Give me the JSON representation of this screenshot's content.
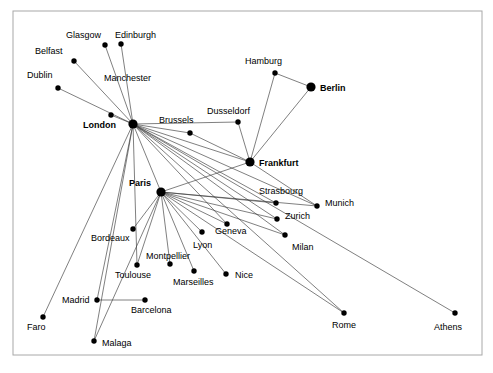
{
  "diagram": {
    "type": "node-link-network",
    "frame": {
      "x": 13,
      "y": 11,
      "width": 469,
      "height": 344,
      "stroke": "#a8a8a8"
    },
    "style": {
      "edge_color": "#3a3a3a",
      "node_color": "#000000",
      "background": "#ffffff",
      "hub_radius": 4.6,
      "node_radius": 2.7
    },
    "nodes": [
      {
        "id": "glasgow",
        "label": "Glasgow",
        "x": 105,
        "y": 45,
        "r": 2.7,
        "hub": false,
        "lx": 66,
        "ly": 38,
        "anchor": "start"
      },
      {
        "id": "edinburgh",
        "label": "Edinburgh",
        "x": 121,
        "y": 44,
        "r": 2.7,
        "hub": false,
        "lx": 115,
        "ly": 38,
        "anchor": "start"
      },
      {
        "id": "belfast",
        "label": "Belfast",
        "x": 74,
        "y": 61,
        "r": 2.7,
        "hub": false,
        "lx": 35,
        "ly": 54,
        "anchor": "start"
      },
      {
        "id": "dublin",
        "label": "Dublin",
        "x": 58,
        "y": 88,
        "r": 2.7,
        "hub": false,
        "lx": 27,
        "ly": 78,
        "anchor": "start"
      },
      {
        "id": "manchester",
        "label": "Manchester",
        "x": 111,
        "y": 115,
        "r": 2.7,
        "hub": false,
        "lx": 104,
        "ly": 81,
        "anchor": "start"
      },
      {
        "id": "london",
        "label": "London",
        "x": 133,
        "y": 124,
        "r": 4.6,
        "hub": true,
        "lx": 83,
        "ly": 128,
        "anchor": "start"
      },
      {
        "id": "brussels",
        "label": "Brussels",
        "x": 190,
        "y": 133,
        "r": 2.7,
        "hub": false,
        "lx": 159,
        "ly": 123,
        "anchor": "start"
      },
      {
        "id": "hamburg",
        "label": "Hamburg",
        "x": 275,
        "y": 73,
        "r": 2.7,
        "hub": false,
        "lx": 245,
        "ly": 64,
        "anchor": "start"
      },
      {
        "id": "berlin",
        "label": "Berlin",
        "x": 311,
        "y": 87,
        "r": 4.6,
        "hub": true,
        "lx": 320,
        "ly": 91,
        "anchor": "start"
      },
      {
        "id": "dusseldorf",
        "label": "Dusseldorf",
        "x": 238,
        "y": 122,
        "r": 2.7,
        "hub": false,
        "lx": 207,
        "ly": 114,
        "anchor": "start"
      },
      {
        "id": "frankfurt",
        "label": "Frankfurt",
        "x": 250,
        "y": 162,
        "r": 4.6,
        "hub": true,
        "lx": 259,
        "ly": 166,
        "anchor": "start"
      },
      {
        "id": "paris",
        "label": "Paris",
        "x": 161,
        "y": 192,
        "r": 4.6,
        "hub": true,
        "lx": 129,
        "ly": 186,
        "anchor": "start"
      },
      {
        "id": "strasbourg",
        "label": "Strasbourg",
        "x": 276,
        "y": 203,
        "r": 2.7,
        "hub": false,
        "lx": 259,
        "ly": 194,
        "anchor": "start"
      },
      {
        "id": "munich",
        "label": "Munich",
        "x": 317,
        "y": 206,
        "r": 2.7,
        "hub": false,
        "lx": 325,
        "ly": 206,
        "anchor": "start"
      },
      {
        "id": "zurich",
        "label": "Zurich",
        "x": 277,
        "y": 219,
        "r": 2.7,
        "hub": false,
        "lx": 285,
        "ly": 219,
        "anchor": "start"
      },
      {
        "id": "geneva",
        "label": "Geneva",
        "x": 227,
        "y": 224,
        "r": 2.7,
        "hub": false,
        "lx": 215,
        "ly": 234,
        "anchor": "start"
      },
      {
        "id": "milan",
        "label": "Milan",
        "x": 285,
        "y": 235,
        "r": 2.7,
        "hub": false,
        "lx": 292,
        "ly": 250,
        "anchor": "start"
      },
      {
        "id": "lyon",
        "label": "Lyon",
        "x": 202,
        "y": 232,
        "r": 2.7,
        "hub": false,
        "lx": 193,
        "ly": 248,
        "anchor": "start"
      },
      {
        "id": "bordeaux",
        "label": "Bordeaux",
        "x": 133,
        "y": 229,
        "r": 2.7,
        "hub": false,
        "lx": 91,
        "ly": 241,
        "anchor": "start"
      },
      {
        "id": "montpellier",
        "label": "Montpellier",
        "x": 170,
        "y": 264,
        "r": 2.7,
        "hub": false,
        "lx": 146,
        "ly": 259,
        "anchor": "start"
      },
      {
        "id": "toulouse",
        "label": "Toulouse",
        "x": 137,
        "y": 265,
        "r": 2.7,
        "hub": false,
        "lx": 115,
        "ly": 278,
        "anchor": "start"
      },
      {
        "id": "marseilles",
        "label": "Marseilles",
        "x": 194,
        "y": 271,
        "r": 2.7,
        "hub": false,
        "lx": 173,
        "ly": 285,
        "anchor": "start"
      },
      {
        "id": "nice",
        "label": "Nice",
        "x": 226,
        "y": 274,
        "r": 2.7,
        "hub": false,
        "lx": 235,
        "ly": 278,
        "anchor": "start"
      },
      {
        "id": "madrid",
        "label": "Madrid",
        "x": 97,
        "y": 300,
        "r": 2.7,
        "hub": false,
        "lx": 62,
        "ly": 303,
        "anchor": "start"
      },
      {
        "id": "barcelona",
        "label": "Barcelona",
        "x": 145,
        "y": 300,
        "r": 2.7,
        "hub": false,
        "lx": 131,
        "ly": 313,
        "anchor": "start"
      },
      {
        "id": "faro",
        "label": "Faro",
        "x": 43,
        "y": 317,
        "r": 2.7,
        "hub": false,
        "lx": 27,
        "ly": 330,
        "anchor": "start"
      },
      {
        "id": "malaga",
        "label": "Malaga",
        "x": 94,
        "y": 341,
        "r": 2.7,
        "hub": false,
        "lx": 102,
        "ly": 346,
        "anchor": "start"
      },
      {
        "id": "rome",
        "label": "Rome",
        "x": 344,
        "y": 313,
        "r": 2.7,
        "hub": false,
        "lx": 332,
        "ly": 328,
        "anchor": "start"
      },
      {
        "id": "athens",
        "label": "Athens",
        "x": 455,
        "y": 313,
        "r": 2.7,
        "hub": false,
        "lx": 434,
        "ly": 330,
        "anchor": "start"
      }
    ],
    "edges": [
      {
        "from": "london",
        "to": "glasgow"
      },
      {
        "from": "london",
        "to": "edinburgh"
      },
      {
        "from": "london",
        "to": "belfast"
      },
      {
        "from": "london",
        "to": "dublin"
      },
      {
        "from": "london",
        "to": "manchester"
      },
      {
        "from": "london",
        "to": "brussels"
      },
      {
        "from": "london",
        "to": "frankfurt"
      },
      {
        "from": "london",
        "to": "dusseldorf"
      },
      {
        "from": "london",
        "to": "paris"
      },
      {
        "from": "london",
        "to": "strasbourg"
      },
      {
        "from": "london",
        "to": "zurich"
      },
      {
        "from": "london",
        "to": "geneva"
      },
      {
        "from": "london",
        "to": "milan"
      },
      {
        "from": "london",
        "to": "munich"
      },
      {
        "from": "london",
        "to": "rome"
      },
      {
        "from": "london",
        "to": "athens"
      },
      {
        "from": "london",
        "to": "madrid"
      },
      {
        "from": "london",
        "to": "malaga"
      },
      {
        "from": "london",
        "to": "faro"
      },
      {
        "from": "london",
        "to": "toulouse"
      },
      {
        "from": "paris",
        "to": "bordeaux"
      },
      {
        "from": "paris",
        "to": "toulouse"
      },
      {
        "from": "paris",
        "to": "montpellier"
      },
      {
        "from": "paris",
        "to": "marseilles"
      },
      {
        "from": "paris",
        "to": "nice"
      },
      {
        "from": "paris",
        "to": "lyon"
      },
      {
        "from": "paris",
        "to": "geneva"
      },
      {
        "from": "paris",
        "to": "strasbourg"
      },
      {
        "from": "paris",
        "to": "zurich"
      },
      {
        "from": "paris",
        "to": "milan"
      },
      {
        "from": "paris",
        "to": "munich"
      },
      {
        "from": "paris",
        "to": "frankfurt"
      },
      {
        "from": "paris",
        "to": "malaga"
      },
      {
        "from": "paris",
        "to": "rome"
      },
      {
        "from": "frankfurt",
        "to": "hamburg"
      },
      {
        "from": "frankfurt",
        "to": "berlin"
      },
      {
        "from": "frankfurt",
        "to": "dusseldorf"
      },
      {
        "from": "frankfurt",
        "to": "munich"
      },
      {
        "from": "frankfurt",
        "to": "brussels"
      },
      {
        "from": "hamburg",
        "to": "berlin"
      },
      {
        "from": "madrid",
        "to": "barcelona"
      }
    ]
  }
}
